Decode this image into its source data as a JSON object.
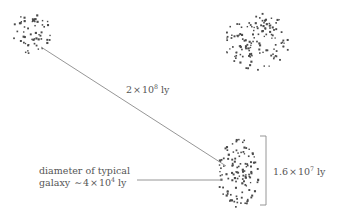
{
  "figure": {
    "kind": "astronomy-scale-diagram",
    "background_color": "#ffffff",
    "ink_color": "#555555",
    "dot_color": "#4a4a4a",
    "line_color": "#8a8a8a"
  },
  "labels": {
    "distance_between_clusters": {
      "mantissa": "2",
      "times": "×",
      "base": "10",
      "exponent": "8",
      "unit": "ly",
      "full_text": "2 × 10⁸ ly"
    },
    "cluster_size": {
      "mantissa": "1.6",
      "times": "×",
      "base": "10",
      "exponent": "7",
      "unit": "ly",
      "full_text": "1.6 × 10⁷ ly"
    },
    "galaxy_diameter": {
      "line1": "diameter of typical",
      "line2_prefix": "galaxy",
      "approx": "∼",
      "mantissa": "4",
      "times": "×",
      "base": "10",
      "exponent": "4",
      "unit": "ly",
      "full_text": "diameter of typical galaxy ∼ 4 × 10⁴ ly"
    }
  },
  "clusters": [
    {
      "name": "upper-left-cluster",
      "center_x": 32,
      "center_y": 33,
      "radius_x": 19,
      "radius_y": 21,
      "dot_count": 58
    },
    {
      "name": "upper-right-cluster",
      "center_x": 257,
      "center_y": 41,
      "radius_x": 33,
      "radius_y": 29,
      "dot_count": 132
    },
    {
      "name": "lower-right-cluster",
      "center_x": 238,
      "center_y": 173,
      "radius_x": 21,
      "radius_y": 35,
      "dot_count": 118
    }
  ],
  "connectors": {
    "distance_line": {
      "x1": 41,
      "y1": 47,
      "x2": 226,
      "y2": 166
    },
    "galaxy_leader_line": {
      "x1": 137,
      "y1": 180,
      "x2": 222,
      "y2": 180
    },
    "size_bracket": {
      "x": 266,
      "y_top": 136,
      "y_bottom": 205,
      "tick_length": 6
    }
  }
}
